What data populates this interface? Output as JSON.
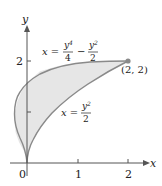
{
  "diagram": {
    "axes": {
      "x_label": "x",
      "y_label": "y",
      "x_ticks": [
        "0",
        "1",
        "2"
      ],
      "y_ticks": [
        "1",
        "2"
      ]
    },
    "curves": [
      {
        "name": "quartic",
        "eq_lhs": "x =",
        "num1": "y",
        "num1_exp": "4",
        "den1": "4",
        "op": "−",
        "num2": "y",
        "num2_exp": "2",
        "den2": "2"
      },
      {
        "name": "parabola",
        "eq_lhs": "x =",
        "num": "y",
        "num_exp": "2",
        "den": "2"
      }
    ],
    "point_label": "(2, 2)",
    "colors": {
      "axis": "#555555",
      "curve": "#8a8a8a",
      "fill": "#e6e6e6"
    }
  }
}
